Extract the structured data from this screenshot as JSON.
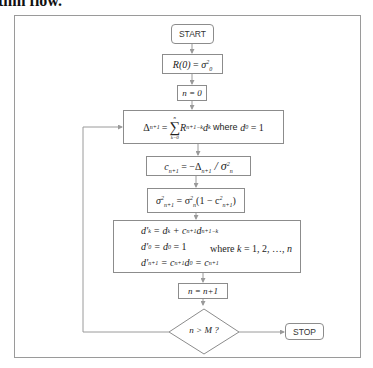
{
  "heading": "thm flow.",
  "flowchart": {
    "start_label": "START",
    "init_r": {
      "lhs": "R(0)",
      "eq": " = ",
      "rhs": "σ",
      "rhs_sub": "0",
      "rhs_sup": "2"
    },
    "init_n": "n = 0",
    "delta": {
      "lhs": "Δ",
      "lhs_sub": "n+1",
      "eq": " = ",
      "sum": "∑",
      "sum_top": "n",
      "sum_bottom": "k=0",
      "term": "R",
      "term_sub": "n+1−k",
      "term2": "d",
      "term2_sub": "k",
      "where": " where ",
      "cond": "d",
      "cond_sub": "0",
      "cond_rhs": " = 1"
    },
    "coef": {
      "lhs": "c",
      "lhs_sub": "n+1",
      "eq": " = −Δ",
      "d_sub": "n+1",
      "div": " / σ",
      "div_sub": "n",
      "div_sup": "2"
    },
    "var": {
      "lhs": "σ",
      "lhs_sub": "n+1",
      "lhs_sup": "2",
      "eq": " = σ",
      "rhs_sub": "n",
      "rhs_sup": "2",
      "paren_open": "(1 − c",
      "c_sub": "n+1",
      "c_sup": "2",
      "paren_close": ")"
    },
    "update": {
      "line1": {
        "a": "d'",
        "a_sub": "k",
        "b": " = d",
        "b_sub": "k",
        "c": " + c",
        "c_sub": "n+1",
        "d": "d",
        "d_sub": "n+1−k"
      },
      "line2": {
        "a": "d'",
        "a_sub": "0",
        "b": " = d",
        "b_sub": "0",
        "c": " = 1"
      },
      "line3": {
        "a": "d'",
        "a_sub": "n+1",
        "b": " = c",
        "b_sub": "n+1",
        "c": "d",
        "c_sub": "0",
        "d": " = c",
        "d_sub": "n+1"
      },
      "where_text": "where ",
      "where_var": "k",
      "where_rest": " = 1, 2, …, ",
      "where_end": "n"
    },
    "increment": "n = n+1",
    "decision": "n > M ?",
    "stop_label": "STOP"
  },
  "colors": {
    "line": "#9a9a9a",
    "box_border": "#8c8c8c",
    "text": "#222222"
  }
}
